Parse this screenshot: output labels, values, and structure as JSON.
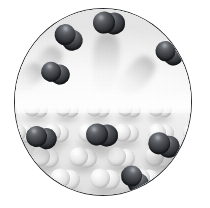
{
  "figure": {
    "shape": "circle",
    "border_color": "#23262b",
    "background_color": "#ffffff",
    "width": 210,
    "height": 208,
    "circle": {
      "left": 14,
      "top": 8,
      "width": 178,
      "height": 188
    }
  },
  "regions": {
    "gas_phase": {
      "name": "gas-phase",
      "label": "Gas phase",
      "top_percent": 0,
      "height_percent": 49,
      "background_color": "#f7f7f7"
    },
    "surface_phase": {
      "name": "surface-phase",
      "label": "Adsorbent surface",
      "top_percent": 48,
      "height_percent": 52,
      "background_color": "#ebebeb"
    },
    "horizon": {
      "label": "Horizon glow",
      "top_percent": 44,
      "height_percent": 12
    }
  },
  "colors": {
    "dark_atom": "#2a2d32",
    "dark_atom_highlight": "#8f9298",
    "light_atom": "#ededed",
    "light_atom_highlight": "#ffffff",
    "trail": "#b4b4b4",
    "outline": "#23262b"
  },
  "gas_molecules": [
    {
      "id": "gas-1",
      "x": 68,
      "y": 36,
      "r": 10.5,
      "gap": 9.5,
      "angle": 38,
      "trail": {
        "x": 46,
        "y": 48,
        "w": 22,
        "h": 42,
        "angle": 38
      }
    },
    {
      "id": "gas-2",
      "x": 108,
      "y": 22,
      "r": 11.0,
      "gap": 10.0,
      "angle": 5,
      "trail": {
        "x": 94,
        "y": 32,
        "w": 26,
        "h": 62,
        "angle": 4
      }
    },
    {
      "id": "gas-3",
      "x": 168,
      "y": 52,
      "r": 10.0,
      "gap": 9.0,
      "angle": 28,
      "trail": {
        "x": 138,
        "y": 58,
        "w": 24,
        "h": 50,
        "angle": 40
      }
    },
    {
      "id": "gas-4",
      "x": 54,
      "y": 72,
      "r": 10.0,
      "gap": 9.0,
      "angle": 18,
      "trail": {
        "x": 30,
        "y": 66,
        "w": 20,
        "h": 34,
        "angle": 52
      }
    }
  ],
  "adsorbed_molecules": [
    {
      "id": "ads-1",
      "x": 40,
      "y": 136,
      "r": 10.5,
      "gap": 10.0,
      "angle": 12
    },
    {
      "id": "ads-2",
      "x": 101,
      "y": 134,
      "r": 11.0,
      "gap": 10.5,
      "angle": 6
    },
    {
      "id": "ads-3",
      "x": 163,
      "y": 144,
      "r": 11.0,
      "gap": 10.5,
      "angle": 20
    },
    {
      "id": "ads-4",
      "x": 134,
      "y": 178,
      "r": 10.5,
      "gap": 10.0,
      "angle": 48
    }
  ],
  "surface_rows": [
    {
      "row": 1,
      "y": 108,
      "r": 8.0,
      "gap": 7.5,
      "spacing": 31,
      "offset": 4,
      "count": 6,
      "angle": 8
    },
    {
      "row": 2,
      "y": 132,
      "r": 9.0,
      "gap": 8.5,
      "spacing": 35,
      "offset": 20,
      "count": 6,
      "angle": 6
    },
    {
      "row": 3,
      "y": 156,
      "r": 9.5,
      "gap": 9.0,
      "spacing": 38,
      "offset": 6,
      "count": 6,
      "angle": 10
    },
    {
      "row": 4,
      "y": 178,
      "r": 10.0,
      "gap": 9.5,
      "spacing": 40,
      "offset": 24,
      "count": 5,
      "angle": 7
    }
  ],
  "counts": {
    "gas_molecules": 4,
    "adsorbed_molecules": 4,
    "motion_trails": 4
  }
}
